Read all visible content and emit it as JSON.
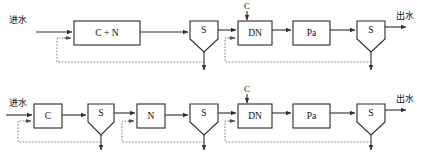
{
  "diagram": {
    "colors": {
      "background": "#ffffff",
      "line": "#2f2f2f",
      "vessel_stroke": "#2b2b2b",
      "recycle_line": "#6e6e6e",
      "text": "#111111"
    },
    "labels": {
      "influent": "进水",
      "effluent": "出水",
      "carbon_dose": "C"
    },
    "rows": [
      {
        "id": "top-row",
        "name": "combined-carbon-nitrification-train",
        "influent_label": "进水",
        "effluent_label": "出水",
        "units": [
          {
            "id": "cn-reactor",
            "label": "C + N",
            "type": "rectangular-reactor"
          },
          {
            "id": "clarifier-1",
            "label": "S",
            "type": "clarifier"
          },
          {
            "id": "dn-reactor",
            "label": "DN",
            "type": "rectangular-reactor"
          },
          {
            "id": "pa-reactor",
            "label": "Pa",
            "type": "rectangular-reactor"
          },
          {
            "id": "clarifier-2",
            "label": "S",
            "type": "clarifier"
          }
        ],
        "dosing": [
          {
            "id": "carbon-dose-top",
            "label": "C",
            "target": "dn-reactor"
          }
        ],
        "recycle_loops": [
          {
            "from": "clarifier-1",
            "to": "cn-reactor"
          },
          {
            "from": "clarifier-2",
            "to": "dn-reactor"
          }
        ],
        "waste_sludge": [
          "clarifier-1",
          "clarifier-2"
        ]
      },
      {
        "id": "bottom-row",
        "name": "separated-carbon-nitrification-train",
        "influent_label": "进水",
        "effluent_label": "出水",
        "units": [
          {
            "id": "c-reactor",
            "label": "C",
            "type": "rectangular-reactor"
          },
          {
            "id": "clarifier-3",
            "label": "S",
            "type": "clarifier"
          },
          {
            "id": "n-reactor",
            "label": "N",
            "type": "rectangular-reactor"
          },
          {
            "id": "clarifier-4",
            "label": "S",
            "type": "clarifier"
          },
          {
            "id": "dn-reactor-2",
            "label": "DN",
            "type": "rectangular-reactor"
          },
          {
            "id": "pa-reactor-2",
            "label": "Pa",
            "type": "rectangular-reactor"
          },
          {
            "id": "clarifier-5",
            "label": "S",
            "type": "clarifier"
          }
        ],
        "dosing": [
          {
            "id": "carbon-dose-bottom",
            "label": "C",
            "target": "dn-reactor-2"
          }
        ],
        "recycle_loops": [
          {
            "from": "clarifier-3",
            "to": "c-reactor"
          },
          {
            "from": "clarifier-4",
            "to": "n-reactor"
          },
          {
            "from": "clarifier-5",
            "to": "dn-reactor-2"
          }
        ],
        "waste_sludge": [
          "clarifier-3",
          "clarifier-4",
          "clarifier-5"
        ]
      }
    ]
  }
}
